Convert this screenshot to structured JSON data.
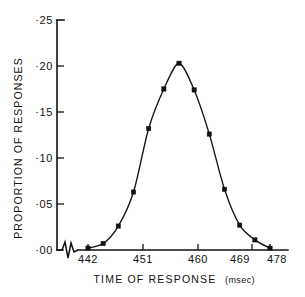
{
  "figure": {
    "background": "#ffffff",
    "ink_color": "#111111"
  },
  "chart_data": {
    "type": "line",
    "title": "",
    "xlabel": "TIME OF RESPONSE",
    "xlabel_unit": "(msec)",
    "ylabel": "PROPORTION OF RESPONSES",
    "x": [
      442,
      445,
      448,
      451,
      454,
      457,
      460,
      463,
      466,
      469,
      472,
      475,
      478
    ],
    "values": [
      0.002,
      0.007,
      0.026,
      0.063,
      0.132,
      0.175,
      0.203,
      0.174,
      0.126,
      0.066,
      0.027,
      0.011,
      0.002
    ],
    "series": [
      {
        "name": "proportion of responses",
        "values": [
          0.002,
          0.007,
          0.026,
          0.063,
          0.132,
          0.175,
          0.203,
          0.174,
          0.126,
          0.066,
          0.027,
          0.011,
          0.002
        ]
      }
    ],
    "xlim": [
      440.5,
      479.5
    ],
    "ylim": [
      0.0,
      0.25
    ],
    "xticks": [
      442,
      451,
      460,
      469,
      478
    ],
    "xticklabels": [
      "442",
      "451",
      "460",
      "469",
      "478"
    ],
    "yticks": [
      0.0,
      0.05,
      0.1,
      0.15,
      0.2,
      0.25
    ],
    "yticklabels": [
      "·00",
      "·05",
      "·10",
      "·15",
      "·20",
      "·25"
    ],
    "grid": false,
    "legend": null,
    "marker": "filled-square",
    "axis_break": {
      "axis": "x",
      "present": true,
      "note": "zigzag break between origin and first tick"
    }
  },
  "axis_labels": {
    "y_tick_0": "·00",
    "y_tick_1": "·05",
    "y_tick_2": "·10",
    "y_tick_3": "·15",
    "y_tick_4": "·20",
    "y_tick_5": "·25",
    "x_tick_0": "442",
    "x_tick_1": "451",
    "x_tick_2": "460",
    "x_tick_3": "469",
    "x_tick_4": "478",
    "x_title": "TIME OF RESPONSE",
    "x_unit": "(msec)",
    "y_title": "PROPORTION OF RESPONSES"
  }
}
